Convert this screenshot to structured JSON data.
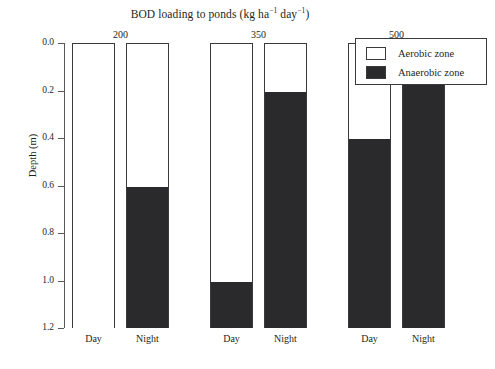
{
  "chart_data": {
    "type": "bar",
    "title_parts": {
      "lead": "BOD loading to ponds (kg ha",
      "sup1": "−1",
      "mid": " day",
      "sup2": "−1",
      "tail": ")"
    },
    "xlabel": "",
    "ylabel": "Depth (m)",
    "ylim": [
      0.0,
      1.2
    ],
    "y_inverted": true,
    "grid": false,
    "legend_position": "top-right",
    "stacked": true,
    "group_label_title": "BOD loading to ponds",
    "groups": [
      {
        "load": "200",
        "bars": [
          {
            "label": "Day",
            "aerobic_depth": 1.2,
            "anaerobic_from": 1.2
          },
          {
            "label": "Night",
            "aerobic_depth": 0.6,
            "anaerobic_from": 0.6
          }
        ]
      },
      {
        "load": "350",
        "bars": [
          {
            "label": "Day",
            "aerobic_depth": 1.0,
            "anaerobic_from": 1.0
          },
          {
            "label": "Night",
            "aerobic_depth": 0.2,
            "anaerobic_from": 0.2
          }
        ]
      },
      {
        "load": "500",
        "bars": [
          {
            "label": "Day",
            "aerobic_depth": 0.4,
            "anaerobic_from": 0.4
          },
          {
            "label": "Night",
            "aerobic_depth": 0.04,
            "anaerobic_from": 0.04
          }
        ]
      }
    ],
    "series": [
      {
        "name": "Aerobic zone",
        "color": "#ffffff",
        "categories": [
          "200 Day",
          "200 Night",
          "350 Day",
          "350 Night",
          "500 Day",
          "500 Night"
        ],
        "values": [
          1.2,
          0.6,
          1.0,
          0.2,
          0.4,
          0.04
        ]
      },
      {
        "name": "Anaerobic zone",
        "color": "#2a2a2c",
        "categories": [
          "200 Day",
          "200 Night",
          "350 Day",
          "350 Night",
          "500 Day",
          "500 Night"
        ],
        "values": [
          0.0,
          0.6,
          0.2,
          1.0,
          0.8,
          1.16
        ]
      }
    ],
    "y_ticks": [
      {
        "value": 0.0,
        "label": "0.0"
      },
      {
        "value": 0.2,
        "label": "0.2"
      },
      {
        "value": 0.4,
        "label": "0.4"
      },
      {
        "value": 0.6,
        "label": "0.6"
      },
      {
        "value": 0.8,
        "label": "0.8"
      },
      {
        "value": 1.0,
        "label": "1.0"
      },
      {
        "value": 1.2,
        "label": "1.2"
      }
    ],
    "legend": [
      {
        "label": "Aerobic zone",
        "color": "#ffffff"
      },
      {
        "label": "Anaerobic zone",
        "color": "#2a2a2c"
      }
    ],
    "colors": {
      "aerobic": "#ffffff",
      "anaerobic": "#2a2a2c",
      "axis": "#58585b",
      "outline": "#3a3a3c",
      "text": "#231f20",
      "background": "#ffffff"
    }
  }
}
